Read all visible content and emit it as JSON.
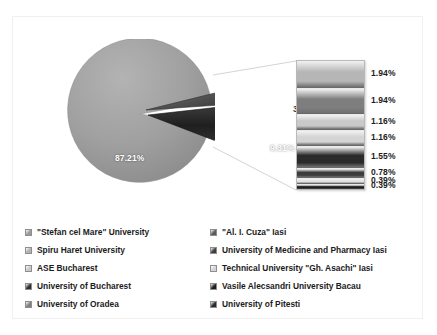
{
  "chart_data": {
    "type": "pie",
    "title": "",
    "subtitle": "",
    "xlabel": "",
    "ylabel": "",
    "variant": "pie-of-pie",
    "grid": false,
    "legend_position": "bottom",
    "primary": {
      "labels": [
        "\"Stefan cel Mare\" University",
        "Spiru Haret University",
        "Other"
      ],
      "values": [
        87.21,
        3.49,
        9.31
      ],
      "value_labels": [
        "87.21%",
        "3.49%",
        "9.31%"
      ],
      "colors": [
        "#9a9a9a",
        "#4a4a4a",
        "#2b2b2b"
      ]
    },
    "secondary": {
      "note": "expanded breakdown of the 9.31% slice, shown as a stacked bar",
      "labels": [
        "ASE Bucharest",
        "University of Bucharest",
        "University of Oradea",
        "\"Al. I. Cuza\" Iasi",
        "University of Medicine and Pharmacy Iasi",
        "Technical University \"Gh. Asachi\" Iasi",
        "Vasile Alecsandri University Bacau",
        "University of Pitesti"
      ],
      "values": [
        1.94,
        1.94,
        1.16,
        1.16,
        1.55,
        0.78,
        0.39,
        0.39
      ],
      "value_labels": [
        "1.94%",
        "1.94%",
        "1.16%",
        "1.16%",
        "1.55%",
        "0.78%",
        "0.39%",
        "0.39%"
      ],
      "colors": [
        "#b6b6b6",
        "#7e7e7e",
        "#c9c9c9",
        "#d4d4d4",
        "#2a2a2a",
        "#3c3c3c",
        "#e2e2e2",
        "#1e1e1e"
      ]
    },
    "legend": {
      "left_column": [
        {
          "label": "\"Stefan cel Mare\" University",
          "color": "#9a9a9a"
        },
        {
          "label": "Spiru Haret University",
          "color": "#b0b0b0"
        },
        {
          "label": "ASE Bucharest",
          "color": "#c9c9c9"
        },
        {
          "label": "University of Bucharest",
          "color": "#2f2f2f"
        },
        {
          "label": "University of Oradea",
          "color": "#808080"
        }
      ],
      "right_column": [
        {
          "label": "\"Al. I. Cuza\" Iasi",
          "color": "#5a5a5a"
        },
        {
          "label": "University of Medicine and Pharmacy Iasi",
          "color": "#3c3c3c"
        },
        {
          "label": "Technical University \"Gh. Asachi\" Iasi",
          "color": "#d4d4d4"
        },
        {
          "label": "Vasile Alecsandri University Bacau",
          "color": "#1e1e1e"
        },
        {
          "label": "University of Pitesti",
          "color": "#2a2a2a"
        }
      ]
    }
  },
  "colors": {
    "frame_border": "#f0f0f0",
    "background": "#ffffff",
    "leader_line": "#d0d0d0",
    "text": "#1b1b1b"
  }
}
